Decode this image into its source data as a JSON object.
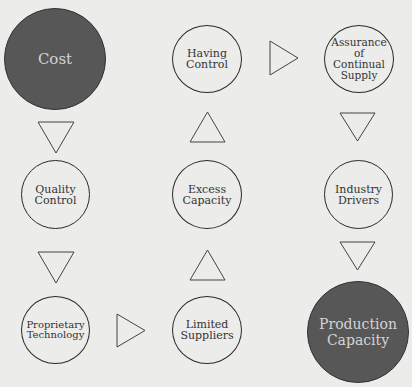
{
  "diagram": {
    "nodes": [
      {
        "id": "cost",
        "label": "Cost",
        "style": "dark"
      },
      {
        "id": "having-control",
        "label": "Having\nControl",
        "style": "outline"
      },
      {
        "id": "assurance",
        "label": "Assurance\nof\nContinual\nSupply",
        "style": "outline"
      },
      {
        "id": "quality-control",
        "label": "Quality\nControl",
        "style": "outline"
      },
      {
        "id": "excess-capacity",
        "label": "Excess\nCapacity",
        "style": "outline"
      },
      {
        "id": "industry-drivers",
        "label": "Industry\nDrivers",
        "style": "outline"
      },
      {
        "id": "proprietary-technology",
        "label": "Proprietary\nTechnology",
        "style": "outline"
      },
      {
        "id": "limited-suppliers",
        "label": "Limited\nSuppliers",
        "style": "outline"
      },
      {
        "id": "production-capacity",
        "label": "Production\nCapacity",
        "style": "dark"
      }
    ],
    "edges": [
      {
        "from": "cost",
        "to": "quality-control",
        "direction": "down"
      },
      {
        "from": "quality-control",
        "to": "proprietary-technology",
        "direction": "down"
      },
      {
        "from": "proprietary-technology",
        "to": "limited-suppliers",
        "direction": "right"
      },
      {
        "from": "limited-suppliers",
        "to": "excess-capacity",
        "direction": "up"
      },
      {
        "from": "excess-capacity",
        "to": "having-control",
        "direction": "up"
      },
      {
        "from": "having-control",
        "to": "assurance",
        "direction": "right"
      },
      {
        "from": "assurance",
        "to": "industry-drivers",
        "direction": "down"
      },
      {
        "from": "industry-drivers",
        "to": "production-capacity",
        "direction": "down"
      }
    ],
    "colors": {
      "dark_fill": "#575757",
      "stroke": "#2a2a2a",
      "background": "#ececea"
    }
  }
}
